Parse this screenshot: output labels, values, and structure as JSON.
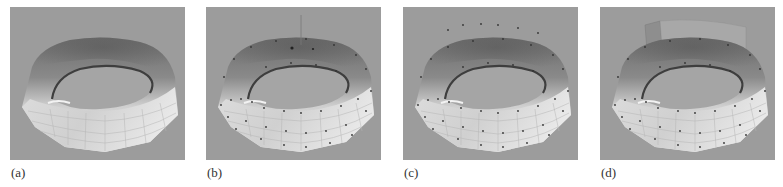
{
  "figure": {
    "background_color": "#9c9c9c",
    "panels": [
      {
        "id": "a",
        "label": "(a)",
        "description": "ring surface mesh, no control points",
        "show_points": false,
        "show_pole": false,
        "show_raised_points": false,
        "show_flap": false
      },
      {
        "id": "b",
        "label": "(b)",
        "description": "ring surface with control points and vertical handle",
        "show_points": true,
        "show_pole": true,
        "show_raised_points": false,
        "show_flap": false
      },
      {
        "id": "c",
        "label": "(c)",
        "description": "ring surface with control points and raised points above",
        "show_points": true,
        "show_pole": false,
        "show_raised_points": true,
        "show_flap": false
      },
      {
        "id": "d",
        "label": "(d)",
        "description": "ring surface deformed with raised back flap",
        "show_points": true,
        "show_pole": false,
        "show_raised_points": false,
        "show_flap": true
      }
    ]
  }
}
